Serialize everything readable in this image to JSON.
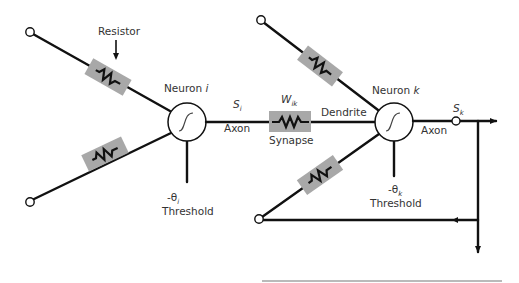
{
  "diagram": {
    "neurons": [
      {
        "id": "i",
        "label_prefix": "Neuron ",
        "label_var": "i",
        "output_var": "S",
        "output_sub": "i",
        "axon_label": "Axon",
        "threshold_sign": "-θ",
        "threshold_sub": "i",
        "threshold_label": "Threshold"
      },
      {
        "id": "k",
        "label_prefix": "Neuron ",
        "label_var": "k",
        "output_var": "S",
        "output_sub": "k",
        "axon_label": "Axon",
        "threshold_sign": "-θ",
        "threshold_sub": "k",
        "threshold_label": "Threshold"
      }
    ],
    "resistor_label": "Resistor",
    "synapse": {
      "weight_var": "W",
      "weight_sub": "ik",
      "label": "Synapse"
    },
    "dendrite_label": "Dendrite",
    "colors": {
      "line": "#111111",
      "resistor_pad": "#a8a8a8",
      "text": "#333333",
      "background": "#ffffff"
    }
  }
}
